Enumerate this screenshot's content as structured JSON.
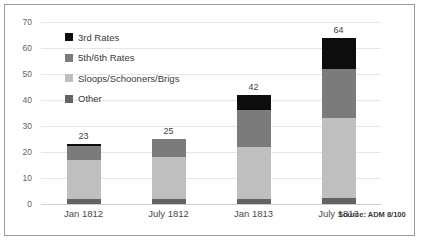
{
  "chart_data": {
    "type": "bar",
    "subtype": "stacked-column",
    "title": "",
    "xlabel": "",
    "ylabel": "",
    "ylim": [
      0,
      70
    ],
    "yticks": [
      0,
      10,
      20,
      30,
      40,
      50,
      60,
      70
    ],
    "grid": true,
    "legend_position": "upper-left-inside",
    "categories": [
      "Jan 1812",
      "July 1812",
      "Jan 1813",
      "July 1813"
    ],
    "totals": [
      23,
      25,
      42,
      64
    ],
    "total_labels": [
      "23",
      "25",
      "42",
      "64"
    ],
    "series": [
      {
        "name": "3rd Rates",
        "color": "#0d0d0d",
        "values": [
          0.5,
          0,
          6,
          12
        ]
      },
      {
        "name": "5th/6th Rates",
        "color": "#7b7b7b",
        "values": [
          5.5,
          7,
          14,
          19
        ]
      },
      {
        "name": "Sloops/Schooners/Brigs",
        "color": "#bfbfbf",
        "values": [
          15,
          16,
          20,
          30.5
        ]
      },
      {
        "name": "Other",
        "color": "#636363",
        "values": [
          2,
          2,
          2,
          2.5
        ]
      }
    ],
    "annotations": [
      {
        "name": "source-note",
        "text": "Source: ADM 8/100"
      }
    ]
  },
  "colors": {
    "frame_border": "#9a9a9a",
    "gridline": "#e6e6e6",
    "tick_text": "#5f5f5f",
    "label_text": "#4a4a4a",
    "background": "#ffffff"
  }
}
